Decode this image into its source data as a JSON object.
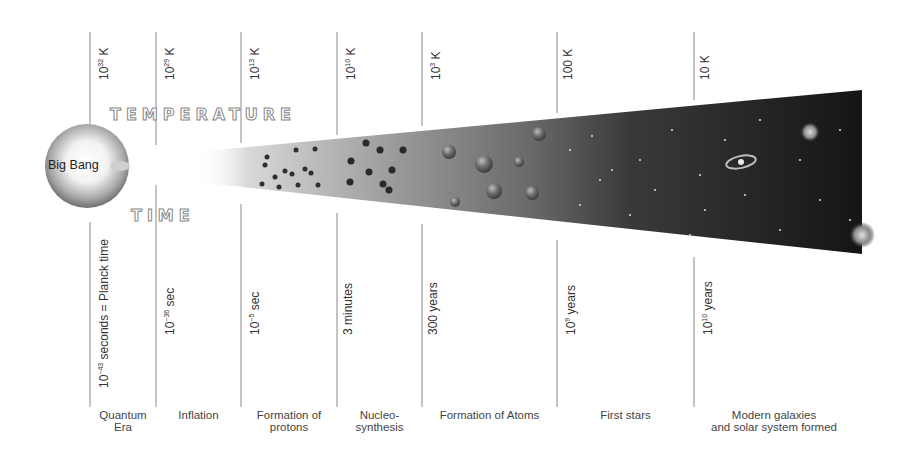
{
  "diagram": {
    "title_temperature": "TEMPERATURE",
    "title_time": "TIME",
    "origin_label": "Big Bang",
    "colors": {
      "line": "#888888",
      "text": "#333333",
      "cone_light": "#ffffff",
      "cone_mid": "#8a8a8a",
      "cone_dark": "#1a1a1a"
    },
    "epochs": [
      {
        "temperature_base": "10",
        "temperature_exp": "32",
        "temperature_unit": " K",
        "time_base": "10",
        "time_exp": "−43",
        "time_unit": " seconds = Planck time",
        "era": "Quantum\nEra"
      },
      {
        "temperature_base": "10",
        "temperature_exp": "29",
        "temperature_unit": " K",
        "time_base": "10",
        "time_exp": "−36",
        "time_unit": " sec",
        "era": "Inflation"
      },
      {
        "temperature_base": "10",
        "temperature_exp": "13",
        "temperature_unit": " K",
        "time_base": "10",
        "time_exp": "−5",
        "time_unit": " sec",
        "era": "Formation of\nprotons"
      },
      {
        "temperature_base": "10",
        "temperature_exp": "10",
        "temperature_unit": " K",
        "time_base": "3 minutes",
        "time_exp": "",
        "time_unit": "",
        "era": "Nucleo-\nsynthesis"
      },
      {
        "temperature_base": "10",
        "temperature_exp": "3",
        "temperature_unit": " K",
        "time_base": "300 years",
        "time_exp": "",
        "time_unit": "",
        "era": "Formation of Atoms"
      },
      {
        "temperature_base": "100 K",
        "temperature_exp": "",
        "temperature_unit": "",
        "time_base": "10",
        "time_exp": "9",
        "time_unit": " years",
        "era": "First stars"
      },
      {
        "temperature_base": "10 K",
        "temperature_exp": "",
        "temperature_unit": "",
        "time_base": "10",
        "time_exp": "10",
        "time_unit": " years",
        "era": "Modern galaxies\nand solar system formed"
      }
    ]
  }
}
